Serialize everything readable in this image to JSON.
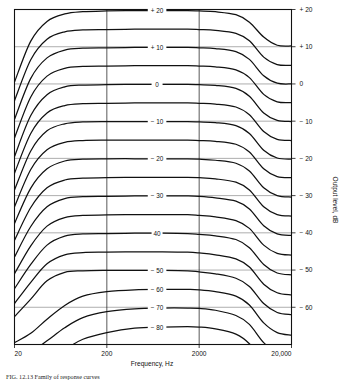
{
  "figure": {
    "caption": "FIG. 12.13   Family of response curves",
    "x_axis": {
      "title": "Frequency, Hz",
      "scale": "log",
      "min": 20,
      "max": 20000,
      "tick_labels": [
        "20",
        "200",
        "2000",
        "20,000"
      ],
      "tick_values": [
        20,
        200,
        2000,
        20000
      ],
      "gridlines_at": [
        200,
        2000
      ]
    },
    "y_axis": {
      "title": "Output level, dB",
      "min": -70,
      "max": 20,
      "tick_labels": [
        "+ 20",
        "+ 10",
        "0",
        "− 10",
        "− 20",
        "− 30",
        "− 40",
        "− 50",
        "− 60"
      ],
      "tick_values": [
        20,
        10,
        0,
        -10,
        -20,
        -30,
        -40,
        -50,
        -60
      ],
      "gridlines_at": [
        10,
        0,
        -10,
        -20,
        -30,
        -40,
        -50,
        -60
      ]
    },
    "curve_labels": [
      {
        "text": "+ 20",
        "level": 20
      },
      {
        "text": "+ 10",
        "level": 10
      },
      {
        "text": "0",
        "level": 0
      },
      {
        "text": "− 10",
        "level": -10
      },
      {
        "text": "− 20",
        "level": -20
      },
      {
        "text": "− 30",
        "level": -30
      },
      {
        "text": "40",
        "level": -40
      },
      {
        "text": "− 50",
        "level": -50
      },
      {
        "text": "− 60",
        "level": -60
      },
      {
        "text": "− 70",
        "level": -70
      },
      {
        "text": "− 80",
        "level": -80
      }
    ]
  },
  "chart_data": {
    "type": "line",
    "title": "",
    "xlabel": "Frequency, Hz",
    "ylabel": "Output level, dB",
    "xscale": "log",
    "xlim": [
      20,
      20000
    ],
    "ylim": [
      -70,
      20
    ],
    "grid": true,
    "legend": "none",
    "x_tick_labels": [
      "20",
      "200",
      "2000",
      "20,000"
    ],
    "x_tick_values": [
      20,
      200,
      2000,
      20000
    ],
    "y_tick_labels": [
      "+ 20",
      "+ 10",
      "0",
      "− 10",
      "− 20",
      "− 30",
      "− 40",
      "− 50",
      "− 60"
    ],
    "y_tick_values": [
      20,
      10,
      0,
      -10,
      -20,
      -30,
      -40,
      -50,
      -60
    ],
    "x": [
      20,
      30,
      45,
      70,
      110,
      200,
      400,
      800,
      1500,
      2000,
      3000,
      5000,
      7000,
      10000,
      14000,
      20000
    ],
    "series": [
      {
        "name": "+ 20",
        "input_dB": 20,
        "label": "+ 20",
        "labeled": true,
        "values": [
          0.5,
          11.5,
          16.8,
          18.8,
          19.4,
          19.6,
          19.7,
          19.7,
          19.7,
          19.6,
          19.4,
          18.6,
          16.6,
          12.6,
          10.4,
          10.2
        ]
      },
      {
        "name": "+ 15",
        "input_dB": 15,
        "label": "",
        "labeled": false,
        "values": [
          -4.5,
          6.5,
          12.0,
          14.0,
          14.5,
          14.6,
          14.7,
          14.7,
          14.7,
          14.6,
          14.4,
          13.6,
          11.6,
          7.2,
          5.2,
          5.0
        ]
      },
      {
        "name": "+ 10",
        "input_dB": 10,
        "label": "+ 10",
        "labeled": true,
        "values": [
          -9.5,
          1.5,
          7.0,
          9.1,
          9.6,
          9.7,
          9.8,
          9.8,
          9.8,
          9.7,
          9.5,
          8.7,
          6.6,
          2.2,
          0.2,
          0.0
        ]
      },
      {
        "name": "+ 5",
        "input_dB": 5,
        "label": "",
        "labeled": false,
        "values": [
          -14.5,
          -3.5,
          2.1,
          4.2,
          4.7,
          4.8,
          4.9,
          4.9,
          4.9,
          4.8,
          4.6,
          3.8,
          1.7,
          -2.8,
          -4.8,
          -5.0
        ]
      },
      {
        "name": "0",
        "input_dB": 0,
        "label": "0",
        "labeled": true,
        "values": [
          -19.5,
          -8.5,
          -2.9,
          -0.8,
          -0.3,
          -0.2,
          -0.1,
          -0.1,
          -0.1,
          -0.2,
          -0.4,
          -1.2,
          -3.3,
          -7.8,
          -9.8,
          -10.1
        ]
      },
      {
        "name": "− 5",
        "input_dB": -5,
        "label": "",
        "labeled": false,
        "values": [
          -24.0,
          -13.3,
          -7.8,
          -5.8,
          -5.3,
          -5.2,
          -5.1,
          -5.1,
          -5.1,
          -5.2,
          -5.4,
          -6.2,
          -8.3,
          -12.8,
          -14.9,
          -15.2
        ]
      },
      {
        "name": "− 10",
        "input_dB": -10,
        "label": "− 10",
        "labeled": true,
        "values": [
          -28.5,
          -18.0,
          -12.6,
          -10.7,
          -10.2,
          -10.1,
          -10.1,
          -10.1,
          -10.1,
          -10.2,
          -10.4,
          -11.2,
          -13.3,
          -17.8,
          -19.9,
          -20.2
        ]
      },
      {
        "name": "− 15",
        "input_dB": -15,
        "label": "",
        "labeled": false,
        "values": [
          -33.0,
          -23.0,
          -17.7,
          -15.7,
          -15.2,
          -15.1,
          -15.1,
          -15.1,
          -15.1,
          -15.2,
          -15.4,
          -16.2,
          -18.3,
          -22.8,
          -24.9,
          -25.2
        ]
      },
      {
        "name": "− 20",
        "input_dB": -20,
        "label": "− 20",
        "labeled": true,
        "values": [
          -37.5,
          -28.0,
          -22.8,
          -20.7,
          -20.2,
          -20.1,
          -20.1,
          -20.1,
          -20.1,
          -20.2,
          -20.5,
          -21.3,
          -23.4,
          -27.9,
          -30.0,
          -30.4
        ]
      },
      {
        "name": "− 25",
        "input_dB": -25,
        "label": "",
        "labeled": false,
        "values": [
          -42.0,
          -33.2,
          -27.9,
          -25.8,
          -25.3,
          -25.2,
          -25.1,
          -25.1,
          -25.1,
          -25.2,
          -25.5,
          -26.4,
          -28.5,
          -33.0,
          -35.1,
          -35.5
        ]
      },
      {
        "name": "− 30",
        "input_dB": -30,
        "label": "− 30",
        "labeled": true,
        "values": [
          -46.5,
          -38.3,
          -33.0,
          -30.8,
          -30.3,
          -30.2,
          -30.1,
          -30.1,
          -30.1,
          -30.2,
          -30.6,
          -31.5,
          -33.6,
          -38.1,
          -40.3,
          -40.7
        ]
      },
      {
        "name": "− 35",
        "input_dB": -35,
        "label": "",
        "labeled": false,
        "values": [
          -51.0,
          -43.5,
          -38.2,
          -35.9,
          -35.3,
          -35.2,
          -35.1,
          -35.1,
          -35.1,
          -35.3,
          -35.7,
          -36.7,
          -38.8,
          -43.3,
          -45.5,
          -46.0
        ]
      },
      {
        "name": "40",
        "input_dB": -40,
        "label": "40",
        "labeled": true,
        "values": [
          -55.0,
          -48.5,
          -43.3,
          -40.9,
          -40.3,
          -40.2,
          -40.1,
          -40.1,
          -40.2,
          -40.4,
          -40.8,
          -41.8,
          -44.0,
          -48.5,
          -50.8,
          -51.3
        ]
      },
      {
        "name": "− 45",
        "input_dB": -45,
        "label": "",
        "labeled": false,
        "values": [
          -59.0,
          -53.3,
          -48.3,
          -45.9,
          -45.3,
          -45.2,
          -45.1,
          -45.1,
          -45.2,
          -45.4,
          -45.9,
          -47.0,
          -49.2,
          -53.8,
          -56.1,
          -56.7
        ]
      },
      {
        "name": "− 50",
        "input_dB": -50,
        "label": "− 50",
        "labeled": true,
        "values": [
          -62.5,
          -57.8,
          -52.9,
          -50.6,
          -50.2,
          -50.1,
          -50.1,
          -50.1,
          -50.2,
          -50.5,
          -51.0,
          -52.2,
          -54.4,
          -59.0,
          -61.4,
          -62.0
        ]
      },
      {
        "name": "− 60",
        "input_dB": -60,
        "label": "− 60",
        "labeled": true,
        "values": [
          -69.5,
          -67.0,
          -63.2,
          -59.5,
          -57.0,
          -55.8,
          -55.3,
          -55.2,
          -55.2,
          -55.3,
          -55.8,
          -57.0,
          -59.4,
          -64.2,
          -66.8,
          -67.5
        ]
      },
      {
        "name": "− 70",
        "input_dB": -70,
        "label": "− 70",
        "labeled": true,
        "values": [
          -74.0,
          -72.0,
          -69.0,
          -65.5,
          -62.8,
          -61.2,
          -60.4,
          -60.2,
          -60.2,
          -60.3,
          -60.8,
          -62.2,
          -64.6,
          -69.5,
          -72.0,
          -72.8
        ]
      },
      {
        "name": "− 80",
        "input_dB": -80,
        "label": "− 80",
        "labeled": true,
        "values": [
          -79.0,
          -77.2,
          -74.6,
          -71.4,
          -68.6,
          -66.8,
          -65.6,
          -65.3,
          -65.2,
          -65.3,
          -65.8,
          -67.2,
          -69.8,
          -74.8,
          -77.4,
          -78.2
        ]
      }
    ],
    "note": "Family of overlapping frequency-response curves at successive input levels; each curve shows low-frequency roll-off below ~100 Hz and high-frequency roll-off above ~5 kHz."
  },
  "colors": {
    "curve": "#111111",
    "axis": "#111111",
    "gridline": "#777777",
    "background": "#ffffff"
  }
}
